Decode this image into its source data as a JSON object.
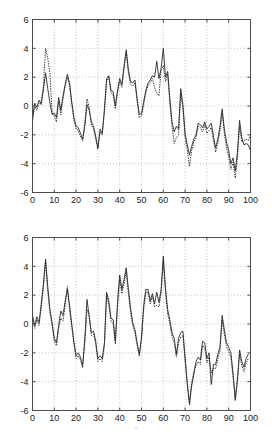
{
  "figure": {
    "title": "",
    "background": "#ffffff",
    "artifact_text": "^"
  },
  "axis_style": {
    "axis_color": "#4d4d4d",
    "grid_color": "#a8a8a8",
    "series_color": "#1f1f1f",
    "grid": "on"
  },
  "chart_data": [
    {
      "type": "line",
      "title": "",
      "subtitle": "",
      "xlabel": "",
      "ylabel": "",
      "xlim": [
        0,
        100
      ],
      "ylim": [
        -6,
        6
      ],
      "xticks": [
        0,
        10,
        20,
        30,
        40,
        50,
        60,
        70,
        80,
        90,
        100
      ],
      "yticks": [
        -6,
        -4,
        -2,
        0,
        2,
        4,
        6
      ],
      "xtick_labels": [
        "0",
        "10",
        "20",
        "30",
        "40",
        "50",
        "60",
        "70",
        "80",
        "90",
        "100"
      ],
      "ytick_labels": [
        "-6",
        "-4",
        "-2",
        "0",
        "2",
        "4",
        "6"
      ],
      "grid": true,
      "legend": null,
      "legend_position": "none",
      "annotations": [],
      "x": [
        0,
        1,
        2,
        3,
        4,
        5,
        6,
        7,
        8,
        9,
        10,
        11,
        12,
        13,
        14,
        15,
        16,
        17,
        18,
        19,
        20,
        21,
        22,
        23,
        24,
        25,
        26,
        27,
        28,
        29,
        30,
        31,
        32,
        33,
        34,
        35,
        36,
        37,
        38,
        39,
        40,
        41,
        42,
        43,
        44,
        45,
        46,
        47,
        48,
        49,
        50,
        51,
        52,
        53,
        54,
        55,
        56,
        57,
        58,
        59,
        60,
        61,
        62,
        63,
        64,
        65,
        66,
        67,
        68,
        69,
        70,
        71,
        72,
        73,
        74,
        75,
        76,
        77,
        78,
        79,
        80,
        81,
        82,
        83,
        84,
        85,
        86,
        87,
        88,
        89,
        90,
        91,
        92,
        93,
        94,
        95,
        96,
        97,
        98,
        99,
        100
      ],
      "series": [
        {
          "name": "solid-trace",
          "style": "solid",
          "values": [
            -0.9,
            0.2,
            -0.1,
            0.4,
            0.1,
            1.1,
            2.3,
            1.2,
            0.2,
            -0.6,
            -0.5,
            -0.8,
            0.6,
            -0.3,
            0.7,
            1.5,
            2.2,
            1.6,
            0.3,
            -0.8,
            -1.4,
            -1.5,
            -1.9,
            -2.3,
            -1.4,
            0.1,
            -0.3,
            -1.1,
            -1.4,
            -2.1,
            -2.9,
            -1.6,
            -1.9,
            -0.2,
            1.9,
            2.1,
            1.1,
            1.0,
            0.0,
            1.1,
            1.9,
            1.5,
            2.8,
            3.9,
            2.5,
            1.7,
            1.6,
            1.8,
            0.5,
            -0.6,
            -0.5,
            0.3,
            1.1,
            1.6,
            1.8,
            2.1,
            2.0,
            3.1,
            1.9,
            2.6,
            4.0,
            2.0,
            2.4,
            0.5,
            -1.1,
            -1.8,
            -1.4,
            -1.6,
            1.2,
            0.1,
            -1.9,
            -2.7,
            -3.4,
            -2.8,
            -2.3,
            -2.0,
            -1.2,
            -1.3,
            -1.5,
            -1.1,
            -1.6,
            -1.4,
            -1.2,
            -2.1,
            -2.9,
            -2.3,
            -1.4,
            -0.2,
            -1.6,
            -2.5,
            -3.1,
            -4.0,
            -3.6,
            -4.5,
            -3.2,
            -1.0,
            -2.2,
            -2.7,
            -2.6,
            -2.7,
            -3.1
          ]
        },
        {
          "name": "dotted-trace",
          "style": "dotted",
          "values": [
            -1.1,
            0.0,
            -0.3,
            0.2,
            0.3,
            1.4,
            4.0,
            3.3,
            2.2,
            -0.4,
            -0.7,
            -1.1,
            0.3,
            -0.6,
            0.5,
            1.4,
            2.0,
            1.4,
            0.1,
            -1.0,
            -1.6,
            -1.7,
            -2.1,
            -2.4,
            -1.2,
            0.5,
            -0.1,
            -1.3,
            -1.6,
            -2.3,
            -3.0,
            -1.8,
            -2.0,
            -0.4,
            1.7,
            2.0,
            0.9,
            0.8,
            -0.2,
            0.9,
            1.7,
            1.3,
            2.6,
            3.7,
            2.3,
            1.5,
            1.4,
            1.6,
            0.3,
            -0.8,
            -0.7,
            0.1,
            0.9,
            1.4,
            1.6,
            1.9,
            1.3,
            0.9,
            0.7,
            2.5,
            2.8,
            1.7,
            2.2,
            0.2,
            -1.4,
            -2.6,
            -2.2,
            -2.0,
            0.9,
            -0.2,
            -2.2,
            -3.0,
            -4.2,
            -3.1,
            -2.5,
            -2.2,
            -1.4,
            -1.5,
            -1.8,
            -1.3,
            -1.9,
            -1.7,
            -1.5,
            -2.4,
            -3.2,
            -2.6,
            -1.7,
            -0.5,
            -1.9,
            -2.9,
            -3.5,
            -4.4,
            -3.9,
            -5.0,
            -3.6,
            -1.4,
            -2.5,
            -2.4,
            -2.3,
            -2.4,
            -2.0
          ]
        }
      ]
    },
    {
      "type": "line",
      "title": "",
      "subtitle": "",
      "xlabel": "",
      "ylabel": "",
      "xlim": [
        0,
        100
      ],
      "ylim": [
        -6,
        6
      ],
      "xticks": [
        0,
        10,
        20,
        30,
        40,
        50,
        60,
        70,
        80,
        90,
        100
      ],
      "yticks": [
        -6,
        -4,
        -2,
        0,
        2,
        4,
        6
      ],
      "xtick_labels": [
        "0",
        "10",
        "20",
        "30",
        "40",
        "50",
        "60",
        "70",
        "80",
        "90",
        "100"
      ],
      "ytick_labels": [
        "-6",
        "-4",
        "-2",
        "0",
        "2",
        "4",
        "6"
      ],
      "grid": true,
      "legend": null,
      "legend_position": "none",
      "annotations": [],
      "x": [
        0,
        1,
        2,
        3,
        4,
        5,
        6,
        7,
        8,
        9,
        10,
        11,
        12,
        13,
        14,
        15,
        16,
        17,
        18,
        19,
        20,
        21,
        22,
        23,
        24,
        25,
        26,
        27,
        28,
        29,
        30,
        31,
        32,
        33,
        34,
        35,
        36,
        37,
        38,
        39,
        40,
        41,
        42,
        43,
        44,
        45,
        46,
        47,
        48,
        49,
        50,
        51,
        52,
        53,
        54,
        55,
        56,
        57,
        58,
        59,
        60,
        61,
        62,
        63,
        64,
        65,
        66,
        67,
        68,
        69,
        70,
        71,
        72,
        73,
        74,
        75,
        76,
        77,
        78,
        79,
        80,
        81,
        82,
        83,
        84,
        85,
        86,
        87,
        88,
        89,
        90,
        91,
        92,
        93,
        94,
        95,
        96,
        97,
        98,
        99,
        100
      ],
      "series": [
        {
          "name": "solid-trace",
          "style": "solid",
          "values": [
            0.6,
            -0.1,
            0.5,
            0.1,
            1.4,
            2.8,
            4.5,
            2.6,
            1.0,
            0.1,
            -1.0,
            -1.3,
            -0.1,
            0.9,
            0.6,
            1.6,
            2.4,
            1.3,
            0.0,
            -1.2,
            -2.2,
            -2.0,
            -2.3,
            -3.0,
            -1.0,
            1.7,
            0.5,
            -0.6,
            -0.5,
            -1.2,
            -2.4,
            -2.2,
            -2.4,
            -1.3,
            2.2,
            1.6,
            0.4,
            0.3,
            -1.2,
            1.5,
            3.4,
            2.4,
            3.1,
            3.9,
            2.4,
            1.1,
            0.1,
            -0.4,
            -1.3,
            -2.2,
            -0.9,
            1.3,
            2.4,
            2.4,
            1.6,
            2.1,
            1.4,
            2.2,
            1.5,
            2.4,
            4.7,
            2.5,
            1.0,
            0.3,
            -0.6,
            -1.0,
            -2.1,
            -1.0,
            -0.6,
            -0.5,
            -2.3,
            -4.2,
            -5.6,
            -4.3,
            -3.5,
            -2.6,
            -2.3,
            -2.5,
            -1.2,
            -1.3,
            -2.4,
            -2.0,
            -4.2,
            -2.8,
            -2.8,
            -2.1,
            -1.6,
            0.6,
            -0.4,
            -1.3,
            -1.6,
            -2.0,
            -3.4,
            -5.3,
            -4.0,
            -1.8,
            -2.6,
            -3.0,
            -2.4,
            -2.1
          ]
        },
        {
          "name": "dotted-trace",
          "style": "dotted",
          "values": [
            0.4,
            -0.3,
            0.3,
            -0.1,
            1.1,
            2.5,
            4.3,
            2.2,
            0.8,
            -0.1,
            -1.2,
            -1.5,
            -0.3,
            0.4,
            0.2,
            1.3,
            2.6,
            1.0,
            -0.2,
            -1.4,
            -2.4,
            -2.2,
            -2.5,
            -2.8,
            -1.3,
            1.0,
            0.7,
            -0.8,
            -0.7,
            -1.4,
            -2.6,
            -2.4,
            -2.6,
            -1.5,
            2.0,
            1.3,
            0.2,
            0.0,
            -1.4,
            1.2,
            3.1,
            2.1,
            2.8,
            3.6,
            2.1,
            0.8,
            -0.1,
            -0.6,
            -1.5,
            -2.0,
            -1.1,
            1.0,
            2.2,
            2.2,
            1.4,
            1.9,
            1.2,
            1.3,
            1.2,
            2.1,
            4.4,
            2.2,
            0.7,
            0.0,
            -0.9,
            -1.3,
            -2.3,
            -1.3,
            -0.9,
            -0.8,
            -2.6,
            -4.0,
            -5.4,
            -4.1,
            -3.3,
            -2.9,
            -2.6,
            -2.8,
            -1.5,
            -1.6,
            -2.7,
            -2.3,
            -3.4,
            -3.1,
            -3.1,
            -2.4,
            -1.9,
            0.3,
            -0.7,
            -1.6,
            -1.9,
            -2.3,
            -3.7,
            -5.1,
            -3.7,
            -2.1,
            -2.9,
            -3.3,
            -2.7,
            -2.4
          ]
        }
      ]
    }
  ]
}
